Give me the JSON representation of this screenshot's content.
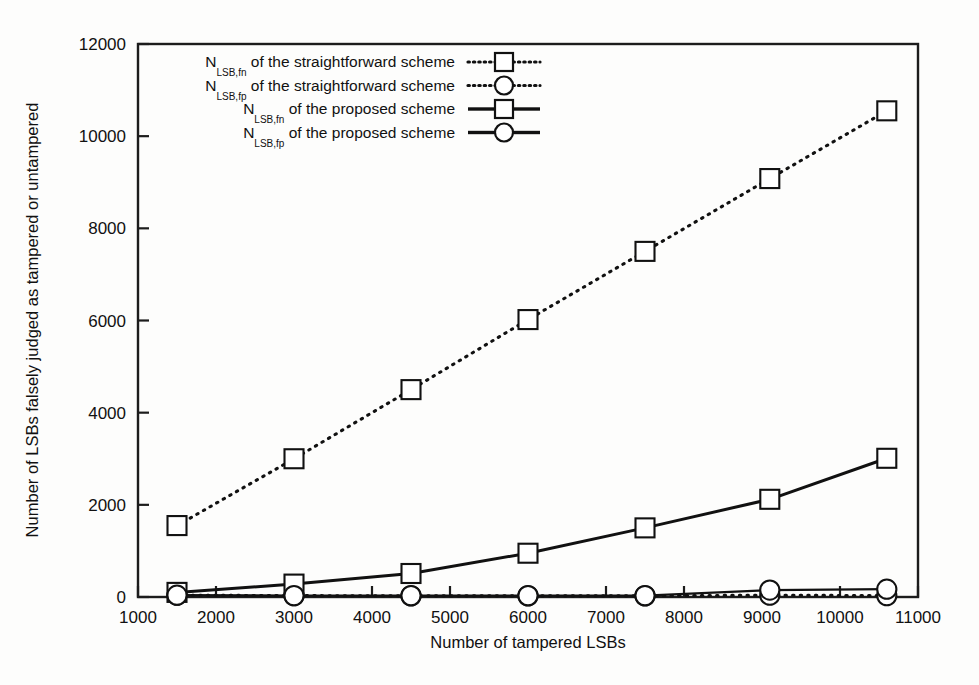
{
  "chart_data": {
    "type": "line",
    "title": "",
    "xlabel": "Number of tampered LSBs",
    "ylabel": "Number of LSBs falsely judged as tampered or untampered",
    "xlim": [
      1000,
      11000
    ],
    "ylim": [
      0,
      12000
    ],
    "xticks": [
      1000,
      2000,
      3000,
      4000,
      5000,
      6000,
      7000,
      8000,
      9000,
      10000,
      11000
    ],
    "yticks": [
      0,
      2000,
      4000,
      6000,
      8000,
      10000,
      12000
    ],
    "grid": false,
    "legend_position": "upper-left-inside",
    "series": [
      {
        "name": "N_LSB,fn of the straightforward scheme",
        "label_prefix": "N",
        "label_subscript": "LSB,fn",
        "label_suffix": "of the straightforward scheme",
        "style": "dotted",
        "marker": "square",
        "x": [
          1500,
          3000,
          4500,
          6000,
          7500,
          9100,
          10600
        ],
        "values": [
          1550,
          3000,
          4500,
          6020,
          7500,
          9080,
          10550
        ]
      },
      {
        "name": "N_LSB,fp of the straightforward scheme",
        "label_prefix": "N",
        "label_subscript": "LSB,fp",
        "label_suffix": "of the straightforward scheme",
        "style": "dotted",
        "marker": "circle",
        "x": [
          1500,
          3000,
          4500,
          6000,
          7500,
          9100,
          10600
        ],
        "values": [
          40,
          30,
          25,
          25,
          25,
          40,
          30
        ]
      },
      {
        "name": "N_LSB,fn of the proposed scheme",
        "label_prefix": "N",
        "label_subscript": "LSB,fn",
        "label_suffix": "of the proposed scheme",
        "style": "solid",
        "marker": "square",
        "x": [
          1500,
          3000,
          4500,
          6000,
          7500,
          9100,
          10600
        ],
        "values": [
          100,
          280,
          510,
          950,
          1500,
          2120,
          3010
        ]
      },
      {
        "name": "N_LSB,fp of the proposed scheme",
        "label_prefix": "N",
        "label_subscript": "LSB,fp",
        "label_suffix": "of the proposed scheme",
        "style": "solid",
        "marker": "circle",
        "x": [
          1500,
          3000,
          4500,
          6000,
          7500,
          9100,
          10600
        ],
        "values": [
          40,
          30,
          30,
          30,
          30,
          150,
          170
        ]
      }
    ]
  },
  "axes": {
    "x_tick_labels": [
      "1000",
      "2000",
      "3000",
      "4000",
      "5000",
      "6000",
      "7000",
      "8000",
      "9000",
      "10000",
      "11000"
    ],
    "y_tick_labels": [
      "0",
      "2000",
      "4000",
      "6000",
      "8000",
      "10000",
      "12000"
    ],
    "x_title": "Number of tampered LSBs",
    "y_title": "Number of LSBs falsely judged as tampered or untampered"
  },
  "legend": {
    "entries": [
      {
        "prefix": "N",
        "subscript": "LSB,fn",
        "text": "of the straightforward scheme",
        "style": "dotted",
        "marker": "square"
      },
      {
        "prefix": "N",
        "subscript": "LSB,fp",
        "text": "of the straightforward scheme",
        "style": "dotted",
        "marker": "circle"
      },
      {
        "prefix": "N",
        "subscript": "LSB,fn",
        "text": "of the proposed scheme",
        "style": "solid",
        "marker": "square"
      },
      {
        "prefix": "N",
        "subscript": "LSB,fp",
        "text": "of the proposed scheme",
        "style": "solid",
        "marker": "circle"
      }
    ]
  },
  "colors": {
    "ink": "#111111",
    "background": "#fdfdfc",
    "marker_fill": "#ffffff"
  }
}
